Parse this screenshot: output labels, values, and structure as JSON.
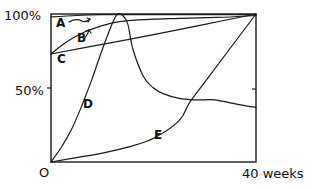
{
  "chart_data": {
    "type": "line",
    "title": "",
    "xlabel": "weeks",
    "ylabel": "",
    "xlim": [
      0,
      40
    ],
    "ylim": [
      0,
      100
    ],
    "grid": false,
    "legend": "inline curve labels",
    "y_tick_labels": [
      "100%",
      "50%"
    ],
    "x_tick_labels": [
      "0",
      "40 weeks"
    ],
    "origin_label": "O",
    "series": [
      {
        "name": "A",
        "x": [
          0,
          5,
          10,
          15,
          20,
          25,
          30,
          35,
          40
        ],
        "values": [
          98,
          99,
          99.5,
          99.5,
          99.5,
          99.5,
          99.5,
          99.5,
          99.5
        ]
      },
      {
        "name": "B",
        "x": [
          0,
          3,
          6,
          9,
          12,
          15,
          20,
          25,
          30,
          35,
          40
        ],
        "values": [
          73,
          81,
          87,
          91,
          94,
          95.5,
          96.5,
          97,
          97.5,
          98,
          99
        ]
      },
      {
        "name": "C",
        "x": [
          0,
          10,
          20,
          30,
          40
        ],
        "values": [
          73,
          79.5,
          86,
          93,
          100
        ]
      },
      {
        "name": "D",
        "x": [
          0,
          2,
          4,
          6,
          8,
          10,
          12,
          13,
          14,
          15,
          16,
          18,
          20,
          22,
          25,
          28,
          30,
          32,
          35,
          38,
          40
        ],
        "values": [
          0,
          10,
          22,
          38,
          56,
          76,
          94,
          100,
          99,
          93,
          76,
          58,
          50,
          46,
          43,
          42,
          42,
          42,
          40,
          38,
          37
        ]
      },
      {
        "name": "E",
        "x": [
          0,
          5,
          10,
          15,
          20,
          25,
          27,
          30,
          35,
          40
        ],
        "values": [
          0,
          3,
          6,
          10,
          16,
          28,
          40,
          54,
          77,
          100
        ]
      }
    ]
  },
  "labels": {
    "y100": "100%",
    "y50": "50%",
    "origin": "O",
    "xend": "40 weeks",
    "A": "A",
    "B": "B",
    "C": "C",
    "D": "D",
    "E": "E"
  }
}
